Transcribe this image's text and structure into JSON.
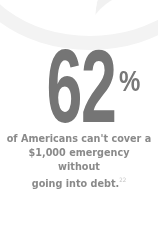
{
  "stat": {
    "value": "62",
    "unit": "%",
    "caption_line1": "of Americans can't cover a",
    "caption_line2": "$1,000 emergency without",
    "caption_line3": "going into debt.",
    "footnote": "22"
  },
  "colors": {
    "number": "#757575",
    "caption": "#8a8a8a",
    "background": "#ffffff"
  }
}
